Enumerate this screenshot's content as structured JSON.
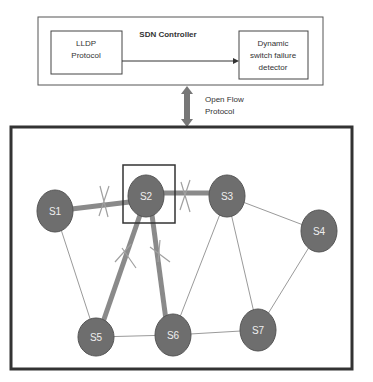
{
  "controller": {
    "title": "SDN Controller",
    "lldp": [
      "LLDP",
      "Protocol"
    ],
    "detector": [
      "Dynamic",
      "switch failure",
      "detector"
    ]
  },
  "link": {
    "label": [
      "Open Flow",
      "Protocol"
    ]
  },
  "network": {
    "nodes": [
      {
        "id": "S1",
        "label": "S1",
        "x": 55,
        "y": 211
      },
      {
        "id": "S2",
        "label": "S2",
        "x": 146,
        "y": 196
      },
      {
        "id": "S3",
        "label": "S3",
        "x": 227,
        "y": 196
      },
      {
        "id": "S4",
        "label": "S4",
        "x": 319,
        "y": 231
      },
      {
        "id": "S5",
        "label": "S5",
        "x": 96,
        "y": 337
      },
      {
        "id": "S6",
        "label": "S6",
        "x": 173,
        "y": 335
      },
      {
        "id": "S7",
        "label": "S7",
        "x": 258,
        "y": 330
      }
    ],
    "failed_links": [
      [
        "S1",
        "S2"
      ],
      [
        "S2",
        "S3"
      ],
      [
        "S2",
        "S5"
      ],
      [
        "S2",
        "S6"
      ]
    ],
    "normal_links": [
      [
        "S1",
        "S5"
      ],
      [
        "S3",
        "S4"
      ],
      [
        "S3",
        "S6"
      ],
      [
        "S3",
        "S7"
      ],
      [
        "S4",
        "S7"
      ],
      [
        "S5",
        "S6"
      ],
      [
        "S6",
        "S7"
      ]
    ],
    "highlighted_switch": "S2"
  },
  "colors": {
    "node": "#6e6e6e",
    "failed_link": "#8a8a8a",
    "link": "#9a9a9a",
    "border": "#333333"
  }
}
